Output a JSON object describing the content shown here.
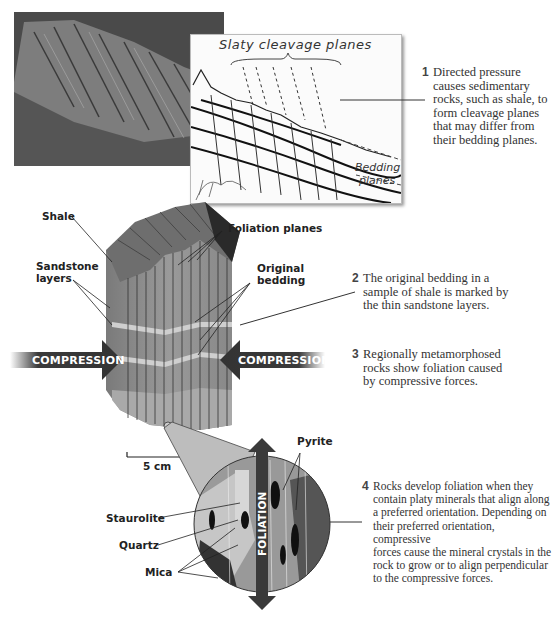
{
  "panel1": {
    "photo_alt": "rock-outcrop-photo",
    "sketch": {
      "title": "Slaty cleavage planes",
      "bedding_label_line1": "Bedding",
      "bedding_label_line2": "planes"
    },
    "caption": {
      "number": "1",
      "text": "Directed pressure causes sedimentary rocks, such as shale, to form cleavage planes that may differ from their bedding planes.",
      "lines": [
        "Directed pressure",
        "causes sedimentary",
        "rocks, such as shale, to",
        "form cleavage planes",
        "that may differ from",
        "their bedding planes."
      ]
    }
  },
  "panel2": {
    "labels": {
      "shale": "Shale",
      "sandstone_line1": "Sandstone",
      "sandstone_line2": "layers",
      "foliation_planes": "Foliation planes",
      "original_line1": "Original",
      "original_line2": "bedding"
    },
    "compression_left": "COMPRESSION",
    "compression_right": "COMPRESSION",
    "caption2": {
      "number": "2",
      "lines": [
        "The original bedding in a",
        "sample of shale is marked by",
        "the thin sandstone layers."
      ]
    },
    "caption3": {
      "number": "3",
      "lines": [
        "Regionally metamorphosed",
        "rocks show foliation caused",
        "by compressive forces."
      ]
    },
    "scale_bar": "5 cm"
  },
  "panel3": {
    "labels": {
      "pyrite": "Pyrite",
      "staurolite": "Staurolite",
      "quartz": "Quartz",
      "mica": "Mica",
      "foliation": "FOLIATION"
    },
    "caption4": {
      "number": "4",
      "lines": [
        "Rocks develop foliation when they",
        "contain platy minerals that align along",
        "a preferred orientation. Depending on",
        "their preferred orientation, compressive",
        "forces cause the mineral crystals in the",
        "rock to grow or to align perpendicular",
        "to the compressive forces."
      ]
    }
  },
  "colors": {
    "arrow": "#3a3a3a",
    "block_face": "#8a8a8a",
    "block_top": "#6e6e6e",
    "sandstone": "#c9c9c9",
    "zoom_cone": "#bdbdbd"
  }
}
